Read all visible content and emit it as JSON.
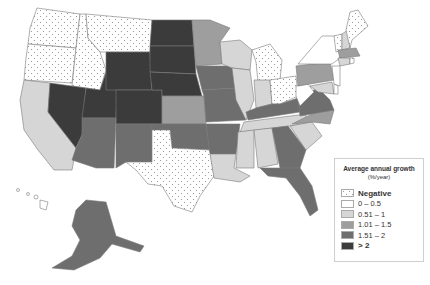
{
  "legend": {
    "title": "Average annual growth",
    "subtitle": "(%/year)",
    "items": [
      {
        "label": "Negative",
        "color": "dots",
        "bold": true
      },
      {
        "label": "0 – 0.5",
        "color": "#ffffff"
      },
      {
        "label": "0.51 – 1",
        "color": "#d6d6d6"
      },
      {
        "label": "1.01 – 1.5",
        "color": "#9e9e9e"
      },
      {
        "label": "1.51 – 2",
        "color": "#6e6e6e"
      },
      {
        "label": "> 2",
        "color": "#3b3b3b"
      }
    ]
  },
  "states": {
    "negative": [
      "WA",
      "OR",
      "ID",
      "MT",
      "TX",
      "MI",
      "OH",
      "ME",
      "VT",
      "RI"
    ],
    "0-0.5": [
      "NY",
      "NJ",
      "WV",
      "DE"
    ],
    "0.51-1": [
      "CA",
      "WI",
      "IL",
      "IN",
      "MS",
      "AL",
      "LA",
      "SC",
      "TN",
      "CT",
      "MD",
      "NE_part"
    ],
    "1.01-1.5": [
      "MN",
      "KS",
      "PA",
      "NC",
      "NH",
      "MA"
    ],
    "1.51-2": [
      "AZ",
      "NM",
      "OK",
      "IA",
      "MO",
      "AR",
      "KY",
      "VA",
      "GA",
      "FL",
      "AK"
    ],
    ">2": [
      "NV",
      "UT",
      "WY",
      "CO",
      "ND",
      "SD",
      "NE"
    ]
  }
}
